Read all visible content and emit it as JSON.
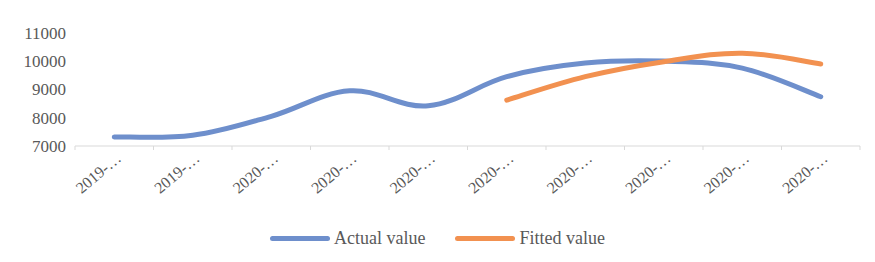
{
  "chart_data": {
    "type": "line",
    "title": "",
    "xlabel": "",
    "ylabel": "",
    "categories": [
      "2019-…",
      "2019-…",
      "2020-…",
      "2020-…",
      "2020-…",
      "2020-…",
      "2020-…",
      "2020-…",
      "2020-…",
      "2020-…"
    ],
    "series": [
      {
        "name": "Actual value",
        "color": "#6e8fcc",
        "values": [
          7320,
          7380,
          8050,
          8950,
          8420,
          9450,
          9930,
          10000,
          9750,
          8740
        ]
      },
      {
        "name": "Fitted value",
        "color": "#f29150",
        "values": [
          null,
          null,
          null,
          null,
          null,
          8620,
          9450,
          9980,
          10280,
          9900
        ]
      }
    ],
    "ylim": [
      7000,
      11000
    ],
    "yticks": [
      7000,
      8000,
      9000,
      10000,
      11000
    ],
    "grid": false,
    "smooth": true,
    "legend_position": "bottom"
  },
  "legend": {
    "actual_label": "Actual value",
    "fitted_label": "Fitted value"
  }
}
